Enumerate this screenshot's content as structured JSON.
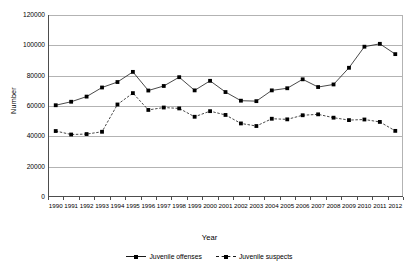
{
  "chart_data": {
    "type": "line",
    "title": "",
    "xlabel": "Year",
    "ylabel": "Number",
    "ylim": [
      0,
      120000
    ],
    "yticks": [
      0,
      20000,
      40000,
      60000,
      80000,
      100000,
      120000
    ],
    "ytick_labels": [
      "0",
      "20000",
      "40000",
      "60000",
      "80000",
      "100000",
      "120000"
    ],
    "grid": true,
    "legend_position": "bottom",
    "categories": [
      "1990",
      "1991",
      "1992",
      "1993",
      "1994",
      "1995",
      "1996",
      "1997",
      "1998",
      "1999",
      "2000",
      "2001",
      "2002",
      "2003",
      "2004",
      "2005",
      "2006",
      "2007",
      "2008",
      "2009",
      "2010",
      "2011",
      "2012"
    ],
    "series": [
      {
        "name": "Juvenile offenses",
        "marker": "square",
        "line_style": "solid",
        "color": "#1a1a1a",
        "values": [
          60500,
          62800,
          66200,
          72200,
          75800,
          82500,
          70200,
          73200,
          79000,
          70300,
          76600,
          69200,
          63500,
          63200,
          70300,
          71700,
          77600,
          72500,
          74200,
          85200,
          99100,
          101000,
          94200
        ]
      },
      {
        "name": "Juvenile suspects",
        "marker": "square",
        "line_style": "dashed",
        "color": "#1a1a1a",
        "values": [
          43500,
          41200,
          41500,
          43000,
          61000,
          68500,
          57400,
          59000,
          58400,
          52900,
          56600,
          54100,
          48500,
          46800,
          51600,
          51200,
          53900,
          54500,
          52300,
          50700,
          51100,
          49500,
          43600
        ]
      }
    ]
  },
  "legend": {
    "items": [
      {
        "label": "Juvenile offenses"
      },
      {
        "label": "Juvenile suspects"
      }
    ]
  }
}
